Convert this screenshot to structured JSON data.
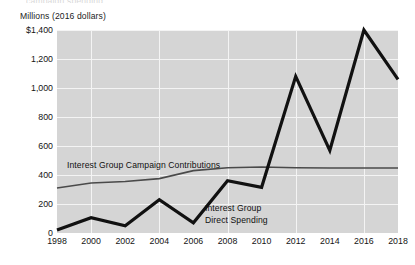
{
  "figure": {
    "ghost_title": "campaign spending",
    "axis_caption": "Millions (2016 dollars)",
    "background_color": "#ffffff",
    "plot_background_color": "#d5d5d5",
    "gridline_color": "#f4f4f4"
  },
  "chart_data": {
    "type": "line",
    "title": "",
    "xlabel": "",
    "ylabel": "Millions (2016 dollars)",
    "categories": [
      "1998",
      "2000",
      "2002",
      "2004",
      "2006",
      "2008",
      "2010",
      "2012",
      "2014",
      "2016",
      "2018"
    ],
    "x": [
      1998,
      2000,
      2002,
      2004,
      2006,
      2008,
      2010,
      2012,
      2014,
      2016,
      2018
    ],
    "ylim": [
      0,
      1400
    ],
    "xlim": [
      1998,
      2018
    ],
    "yticks": [
      0,
      200,
      400,
      600,
      800,
      1000,
      1200,
      1400
    ],
    "ytick_labels": [
      "0",
      "200",
      "400",
      "600",
      "800",
      "1,000",
      "1,200",
      "$1,400"
    ],
    "grid": true,
    "legend_position": "inline-annotations",
    "series": [
      {
        "name": "Interest Group Campaign Contributions",
        "color": "#4a4a4a",
        "line_width": 1.6,
        "values": [
          310,
          345,
          355,
          375,
          430,
          450,
          455,
          450,
          448,
          448,
          448
        ]
      },
      {
        "name": "Interest Group Direct Spending",
        "color": "#111111",
        "line_width": 3.2,
        "values": [
          20,
          105,
          50,
          230,
          70,
          360,
          315,
          1080,
          570,
          1400,
          1060
        ]
      }
    ],
    "annotations": [
      {
        "text": "Interest Group Campaign Contributions",
        "series": "Interest Group Campaign Contributions"
      },
      {
        "text_line1": "Interest Group",
        "text_line2": "Direct Spending",
        "series": "Interest Group Direct Spending"
      }
    ]
  }
}
